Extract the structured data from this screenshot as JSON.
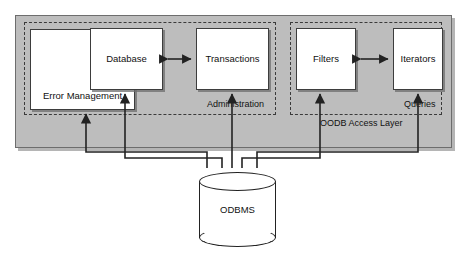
{
  "diagram": {
    "title_label": "OODB Access Layer",
    "panel": {
      "name": "oodb-access-layer-panel",
      "fill": "#bdbdbd",
      "stroke": "#6d6d6d"
    },
    "groups": [
      {
        "id": "administration",
        "label": "Administration",
        "border": "dash-dot"
      },
      {
        "id": "queries",
        "label": "Queries",
        "border": "dash-dot"
      }
    ],
    "components": [
      {
        "id": "error-management",
        "label": "Error Management",
        "group": "administration"
      },
      {
        "id": "database",
        "label": "Database",
        "group": "administration"
      },
      {
        "id": "transactions",
        "label": "Transactions",
        "group": "administration"
      },
      {
        "id": "filters",
        "label": "Filters",
        "group": "queries"
      },
      {
        "id": "iterators",
        "label": "Iterators",
        "group": "queries"
      }
    ],
    "datastore": {
      "id": "odbms",
      "label": "ODBMS",
      "shape": "cylinder"
    },
    "connections": [
      {
        "from": "database",
        "to": "transactions",
        "type": "double-arrow"
      },
      {
        "from": "filters",
        "to": "iterators",
        "type": "double-arrow"
      },
      {
        "from": "odbms",
        "to": "error-management",
        "type": "arrow"
      },
      {
        "from": "odbms",
        "to": "database",
        "type": "arrow"
      },
      {
        "from": "odbms",
        "to": "transactions",
        "type": "arrow"
      },
      {
        "from": "odbms",
        "to": "filters",
        "type": "arrow"
      },
      {
        "from": "odbms",
        "to": "iterators",
        "type": "arrow"
      }
    ],
    "colors": {
      "panel_fill": "#bdbdbd",
      "box_fill": "#ffffff",
      "line": "#222222",
      "text": "#111111"
    }
  }
}
